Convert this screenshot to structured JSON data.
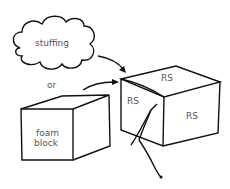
{
  "diagram": {
    "cloud": {
      "label": "stuffing"
    },
    "connector": {
      "label": "or"
    },
    "foam_block": {
      "label_line1": "foam",
      "label_line2": "block"
    },
    "cube": {
      "faces": [
        {
          "label": "RS",
          "face": "top"
        },
        {
          "label": "RS",
          "face": "left"
        },
        {
          "label": "RS",
          "face": "right"
        }
      ]
    },
    "colors": {
      "stroke": "#111111",
      "text": "#555555",
      "background": "#ffffff"
    }
  }
}
